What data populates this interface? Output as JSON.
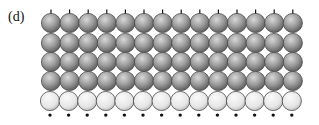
{
  "panel_label": "(d)",
  "lattice": {
    "columns": 14,
    "first_center_x": 51,
    "spacing_x": 18.6,
    "radius": 9.6,
    "rows": [
      {
        "cy": 23,
        "type": "dark",
        "has_top_ticks": true
      },
      {
        "cy": 43,
        "type": "dark"
      },
      {
        "cy": 62,
        "type": "dark"
      },
      {
        "cy": 81,
        "type": "dark"
      },
      {
        "cy": 101,
        "type": "light",
        "has_bottom_dots": true
      }
    ],
    "colors": {
      "dark_fill_light": "#d8d8d8",
      "dark_fill_mid": "#9a9a9a",
      "dark_fill_edge": "#5c5c5c",
      "light_fill_light": "#fafafa",
      "light_fill_edge": "#bdbdbd",
      "outline": "#4a4a4a",
      "marker": "#111111"
    }
  }
}
